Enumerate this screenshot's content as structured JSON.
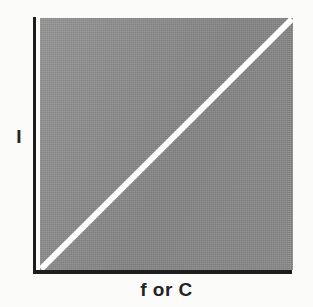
{
  "figure": {
    "name": "linear-relationship-plot",
    "background_color": "#fbfbfa"
  },
  "axes": {
    "y_label": "I",
    "x_label": "f or C",
    "axis_color": "#1d1d1d"
  },
  "plot": {
    "fill_color": "#8d8d8d",
    "line_color": "#ffffff"
  },
  "chart_data": {
    "type": "line",
    "title": "",
    "subtitle": "",
    "xlabel": "f or C",
    "ylabel": "I",
    "xlim": [
      0,
      1
    ],
    "ylim": [
      0,
      1
    ],
    "grid": false,
    "legend": false,
    "legend_position": "none",
    "xticks": [],
    "yticks": [],
    "xticklabels": [],
    "yticklabels": [],
    "annotations": [],
    "background_fill": "#8d8d8d",
    "series": [
      {
        "name": "I vs f or C",
        "color": "#ffffff",
        "linewidth": 6,
        "x": [
          0,
          1
        ],
        "y": [
          0,
          1
        ]
      }
    ]
  }
}
